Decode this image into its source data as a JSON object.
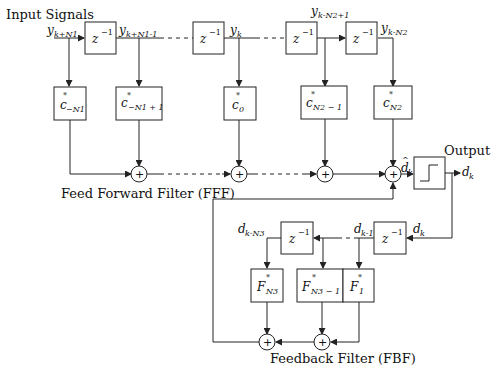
{
  "labels": {
    "input_signals": "Input Signals",
    "output": "Output",
    "fff": "Feed Forward Filter (FFF)",
    "fbf": "Feedback Filter (FBF)"
  },
  "delay": {
    "base": "z",
    "exp": "−1"
  },
  "signals": {
    "y_k_N1": {
      "base": "y",
      "sub": "k+N1"
    },
    "y_k_N1_1": {
      "base": "y",
      "sub": "k+N1-1"
    },
    "y_k": {
      "base": "y",
      "sub": "k"
    },
    "y_k_N2_1": {
      "base": "y",
      "sub": "k-N2+1"
    },
    "y_k_N2": {
      "base": "y",
      "sub": "k-N2"
    },
    "d_hat_k": {
      "base": "d",
      "hat": "^",
      "sub": "k"
    },
    "d_k_out": {
      "base": "d",
      "sub": "k"
    },
    "d_k_fb": {
      "base": "d",
      "sub": "k"
    },
    "d_k_1": {
      "base": "d",
      "sub": "k-1"
    },
    "d_k_N3": {
      "base": "d",
      "sub": "k-N3"
    }
  },
  "ff_taps": [
    {
      "base": "c",
      "sup": "*",
      "sub": "−N1"
    },
    {
      "base": "c",
      "sup": "*",
      "sub": "−N1 + 1"
    },
    {
      "base": "c",
      "sup": "*",
      "sub": "0"
    },
    {
      "base": "c",
      "sup": "*",
      "sub": "N2 − 1"
    },
    {
      "base": "c",
      "sup": "*",
      "sub": "N2"
    }
  ],
  "fb_taps": [
    {
      "base": "F",
      "sup": "*",
      "sub": "N3"
    },
    {
      "base": "F",
      "sup": "*",
      "sub": "N3 − 1"
    },
    {
      "base": "F",
      "sup": "*",
      "sub": "1"
    }
  ],
  "summer_symbol": "+"
}
